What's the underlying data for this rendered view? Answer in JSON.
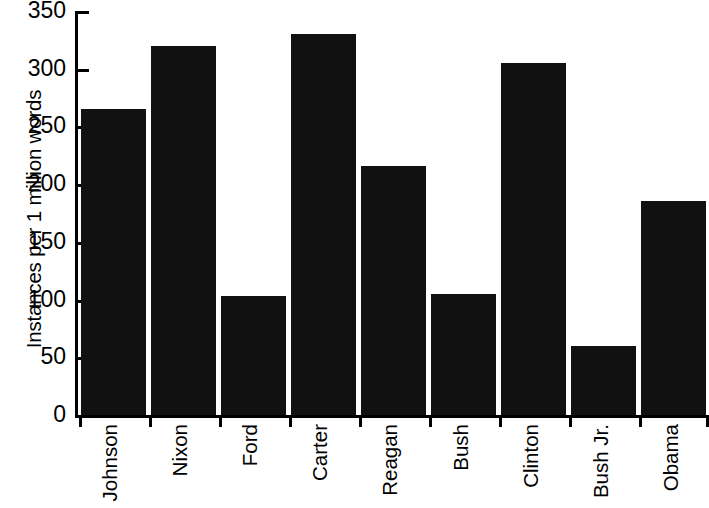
{
  "chart_data": {
    "type": "bar",
    "title": "",
    "subtitle": "",
    "xlabel": "",
    "ylabel": "Instances per 1 million words",
    "categories": [
      "Johnson",
      "Nixon",
      "Ford",
      "Carter",
      "Reagan",
      "Bush",
      "Clinton",
      "Bush Jr.",
      "Obama"
    ],
    "values": [
      265,
      320,
      103,
      330,
      216,
      105,
      305,
      60,
      185
    ],
    "ylim": [
      0,
      350
    ],
    "y_ticks": [
      0,
      50,
      100,
      150,
      200,
      250,
      300,
      350
    ],
    "y_tick_labels": [
      "0",
      "50",
      "100",
      "150",
      "200",
      "250",
      "300",
      "350"
    ],
    "grid": false,
    "legend": null,
    "bar_color": "#111111",
    "background_color": "#ffffff",
    "axis_color": "#000000",
    "annotations": []
  }
}
